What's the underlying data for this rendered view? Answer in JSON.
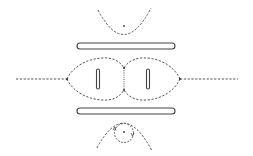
{
  "diagram": {
    "type": "electrostatic-field-lines",
    "colors": {
      "background": "#ffffff",
      "line": "#444444",
      "dashed": "#555555"
    },
    "elements": [
      {
        "name": "top-plate",
        "kind": "electrode-bar"
      },
      {
        "name": "bottom-plate",
        "kind": "electrode-bar"
      },
      {
        "name": "left-inner-electrode",
        "kind": "electrode-rod"
      },
      {
        "name": "right-inner-electrode",
        "kind": "electrode-rod"
      },
      {
        "name": "left-lobe",
        "kind": "separatrix"
      },
      {
        "name": "right-lobe",
        "kind": "separatrix"
      },
      {
        "name": "left-axis-line",
        "kind": "field-line"
      },
      {
        "name": "right-axis-line",
        "kind": "field-line"
      },
      {
        "name": "top-parabola",
        "kind": "field-line"
      },
      {
        "name": "bottom-parabola",
        "kind": "field-line"
      },
      {
        "name": "bottom-orbit-circle",
        "kind": "closed-orbit"
      }
    ]
  }
}
